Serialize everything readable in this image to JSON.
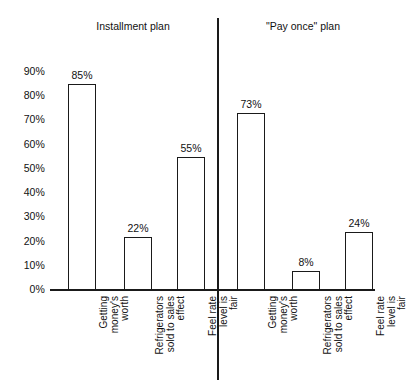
{
  "chart_data": {
    "type": "bar",
    "title": "",
    "subtitle": "",
    "xlabel": "",
    "ylabel": "",
    "ylim": [
      0,
      90
    ],
    "grid": false,
    "legend": null,
    "orientation": "vertical",
    "bar_style": "hollow-outline",
    "y_ticks": [
      "0%",
      "10%",
      "20%",
      "30%",
      "40%",
      "50%",
      "60%",
      "70%",
      "80%",
      "90%"
    ],
    "y_tick_values": [
      0,
      10,
      20,
      30,
      40,
      50,
      60,
      70,
      80,
      90
    ],
    "group_headers": [
      "Installment plan",
      "\"Pay once\" plan"
    ],
    "categories": [
      "Getting\nmoney's\nworth",
      "Refrigerators\nsold to sales\neffect",
      "Feel rate\nlevel is\nfair"
    ],
    "series": [
      {
        "name": "Installment plan",
        "values": [
          85,
          22,
          55
        ]
      },
      {
        "name": "\"Pay once\" plan",
        "values": [
          73,
          8,
          24
        ]
      }
    ],
    "bars": [
      {
        "group": "Installment plan",
        "category": "Getting money's worth",
        "value": 85,
        "label": "85%"
      },
      {
        "group": "Installment plan",
        "category": "Refrigerators sold to sales effect",
        "value": 22,
        "label": "22%"
      },
      {
        "group": "Installment plan",
        "category": "Feel rate level is fair",
        "value": 55,
        "label": "55%"
      },
      {
        "group": "\"Pay once\" plan",
        "category": "Getting money's worth",
        "value": 73,
        "label": "73%"
      },
      {
        "group": "\"Pay once\" plan",
        "category": "Refrigerators sold to sales effect",
        "value": 8,
        "label": "8%"
      },
      {
        "group": "\"Pay once\" plan",
        "category": "Feel rate level is fair",
        "value": 24,
        "label": "24%"
      }
    ],
    "colors": {
      "ink": "#1a1a1a",
      "background": "#ffffff",
      "bar_fill": "#ffffff",
      "bar_outline": "#1a1a1a"
    }
  }
}
